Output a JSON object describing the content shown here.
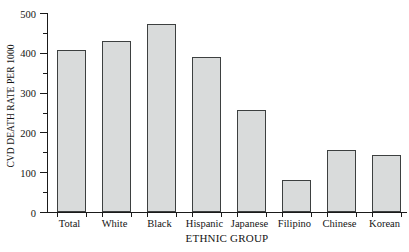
{
  "chart_data": {
    "type": "bar",
    "title": "",
    "xlabel": "ETHNIC GROUP",
    "ylabel": "CVD DEATH RATE PER 1000",
    "categories": [
      "Total",
      "White",
      "Black",
      "Hispanic",
      "Japanese",
      "Filipino",
      "Chinese",
      "Korean"
    ],
    "values": [
      408,
      430,
      472,
      390,
      256,
      81,
      157,
      143
    ],
    "ylim": [
      0,
      500
    ],
    "y_major_ticks": [
      0,
      100,
      200,
      300,
      400,
      500
    ],
    "y_tick_labels": [
      "0",
      "100",
      "200",
      "300",
      "400",
      "500"
    ],
    "y_minor_ticks": [
      50,
      150,
      250,
      350,
      450
    ],
    "grid": false,
    "legend": false,
    "bar_fill_color": "#d9dbdb",
    "bar_border_color": "#3d4040",
    "axis_color": "#1a1a1a"
  }
}
